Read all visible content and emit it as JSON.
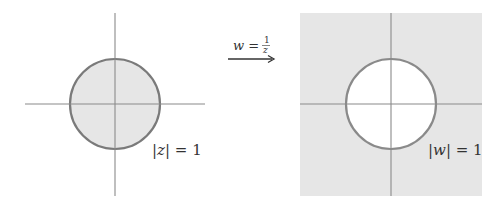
{
  "diagram": {
    "left_panel": {
      "label": "|z| = 1",
      "label_parts": {
        "open_bar": "|",
        "var": "z",
        "close_bar": "|",
        "eq": " = 1"
      },
      "region": "disk interior shaded",
      "fill_color": "#e6e6e6",
      "circle_color": "#7a7a7a",
      "axis_color": "#8a8a8a"
    },
    "mapping": {
      "label": "w = 1/z",
      "label_parts": {
        "lhs": "w",
        "eq": " = ",
        "numerator": "1",
        "denominator": "z"
      },
      "arrow": "right-arrow"
    },
    "right_panel": {
      "label": "|w| = 1",
      "label_parts": {
        "open_bar": "|",
        "var": "w",
        "close_bar": "|",
        "eq": " = 1"
      },
      "region": "disk exterior shaded",
      "fill_color": "#e6e6e6",
      "circle_color": "#8a8a8a",
      "axis_color": "#8a8a8a"
    }
  }
}
